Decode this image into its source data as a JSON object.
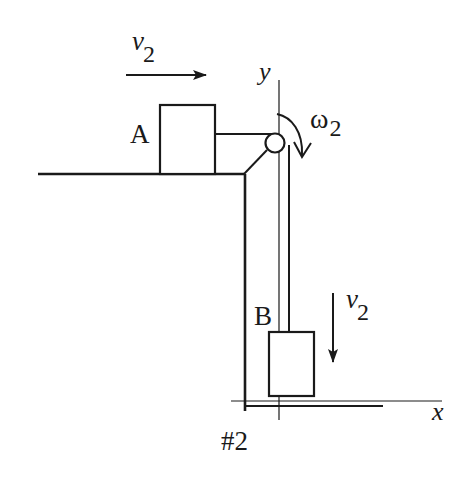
{
  "diagram": {
    "caption": "#2",
    "block_a": {
      "label": "A"
    },
    "block_b": {
      "label": "B"
    },
    "axes": {
      "x_label": "x",
      "y_label": "y"
    },
    "velocity_a": {
      "symbol": "v",
      "subscript": "2",
      "direction": "right"
    },
    "velocity_b": {
      "symbol": "v",
      "subscript": "2",
      "direction": "down"
    },
    "pulley": {
      "angular_velocity_symbol": "ω",
      "subscript": "2",
      "rotation": "clockwise"
    },
    "colors": {
      "ink": "#1a1a1a",
      "background": "#ffffff"
    }
  }
}
